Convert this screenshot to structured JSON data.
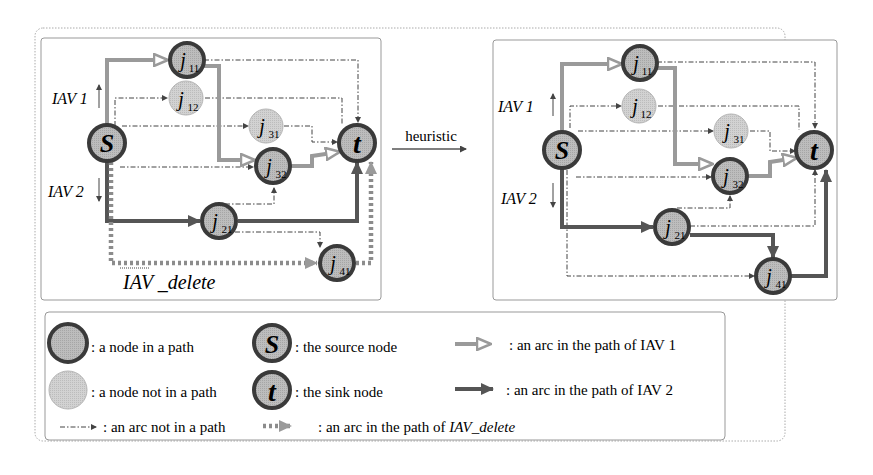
{
  "figure": {
    "transition_label": "heuristic",
    "before": {
      "labels": {
        "iav1": "IAV 1",
        "iav2": "IAV 2",
        "iav_delete": "IAV _delete"
      },
      "nodes": [
        {
          "id": "S",
          "label": "S",
          "sub": "",
          "type": "source"
        },
        {
          "id": "j11",
          "label": "j",
          "sub": "11",
          "type": "in_path"
        },
        {
          "id": "j12",
          "label": "j",
          "sub": "12",
          "type": "not_in_path"
        },
        {
          "id": "j31",
          "label": "j",
          "sub": "31",
          "type": "not_in_path"
        },
        {
          "id": "j32",
          "label": "j",
          "sub": "32",
          "type": "in_path"
        },
        {
          "id": "t",
          "label": "t",
          "sub": "",
          "type": "sink"
        },
        {
          "id": "j21",
          "label": "j",
          "sub": "21",
          "type": "in_path"
        },
        {
          "id": "j41",
          "label": "j",
          "sub": "41",
          "type": "in_path"
        }
      ],
      "arcs": [
        {
          "from": "S",
          "to": "j11",
          "kind": "IAV1"
        },
        {
          "from": "j11",
          "to": "j32",
          "kind": "IAV1"
        },
        {
          "from": "j32",
          "to": "t",
          "kind": "IAV1"
        },
        {
          "from": "S",
          "to": "j21",
          "kind": "IAV2"
        },
        {
          "from": "j21",
          "to": "t",
          "kind": "IAV2"
        },
        {
          "from": "S",
          "to": "j41",
          "kind": "IAV_delete"
        },
        {
          "from": "j41",
          "to": "t",
          "kind": "IAV_delete"
        },
        {
          "from": "S",
          "to": "j12",
          "kind": "not_in_path"
        },
        {
          "from": "S",
          "to": "j31",
          "kind": "not_in_path"
        },
        {
          "from": "S",
          "to": "j32",
          "kind": "not_in_path"
        },
        {
          "from": "j11",
          "to": "t",
          "kind": "not_in_path"
        },
        {
          "from": "j12",
          "to": "t",
          "kind": "not_in_path"
        },
        {
          "from": "j31",
          "to": "t",
          "kind": "not_in_path"
        },
        {
          "from": "j21",
          "to": "j32",
          "kind": "not_in_path"
        },
        {
          "from": "j21",
          "to": "j41",
          "kind": "not_in_path"
        }
      ]
    },
    "after": {
      "labels": {
        "iav1": "IAV 1",
        "iav2": "IAV 2"
      },
      "nodes": [
        {
          "id": "S",
          "label": "S",
          "sub": "",
          "type": "source"
        },
        {
          "id": "j11",
          "label": "j",
          "sub": "11",
          "type": "in_path"
        },
        {
          "id": "j12",
          "label": "j",
          "sub": "12",
          "type": "not_in_path"
        },
        {
          "id": "j31",
          "label": "j",
          "sub": "31",
          "type": "not_in_path"
        },
        {
          "id": "j32",
          "label": "j",
          "sub": "32",
          "type": "in_path"
        },
        {
          "id": "t",
          "label": "t",
          "sub": "",
          "type": "sink"
        },
        {
          "id": "j21",
          "label": "j",
          "sub": "21",
          "type": "in_path"
        },
        {
          "id": "j41",
          "label": "j",
          "sub": "41",
          "type": "in_path"
        }
      ],
      "arcs": [
        {
          "from": "S",
          "to": "j11",
          "kind": "IAV1"
        },
        {
          "from": "j11",
          "to": "j32",
          "kind": "IAV1"
        },
        {
          "from": "j32",
          "to": "t",
          "kind": "IAV1"
        },
        {
          "from": "S",
          "to": "j21",
          "kind": "IAV2"
        },
        {
          "from": "j21",
          "to": "j41",
          "kind": "IAV2"
        },
        {
          "from": "j41",
          "to": "t",
          "kind": "IAV2"
        },
        {
          "from": "S",
          "to": "j12",
          "kind": "not_in_path"
        },
        {
          "from": "S",
          "to": "j31",
          "kind": "not_in_path"
        },
        {
          "from": "S",
          "to": "j32",
          "kind": "not_in_path"
        },
        {
          "from": "S",
          "to": "j41",
          "kind": "not_in_path"
        },
        {
          "from": "j11",
          "to": "t",
          "kind": "not_in_path"
        },
        {
          "from": "j12",
          "to": "t",
          "kind": "not_in_path"
        },
        {
          "from": "j31",
          "to": "t",
          "kind": "not_in_path"
        },
        {
          "from": "j21",
          "to": "j32",
          "kind": "not_in_path"
        },
        {
          "from": "j21",
          "to": "t",
          "kind": "not_in_path"
        }
      ]
    }
  },
  "legend": {
    "node_in_path": ": a node in a path",
    "source_node_symbol": "S",
    "source_node": ": the source node",
    "arc_iav1": ": an arc in the path of IAV 1",
    "node_not_in_path": ": a node not in a path",
    "sink_node_symbol": "t",
    "sink_node": ": the sink node",
    "arc_iav2": ": an arc in the path of IAV 2",
    "arc_not_in_path": ": an arc not in a path",
    "arc_iav_delete_prefix": ": an arc in the path of ",
    "arc_iav_delete_name": "IAV_delete"
  },
  "colors": {
    "node_fill": "#b8b8b8",
    "node_stroke": "#3a3a3a",
    "node_light_fill": "#c9c9c9",
    "iav1_arc": "#9a9a9a",
    "iav2_arc": "#555555",
    "iav_delete_arc": "#8c8c8c",
    "thin_arc": "#444444",
    "frame": "#999999"
  }
}
